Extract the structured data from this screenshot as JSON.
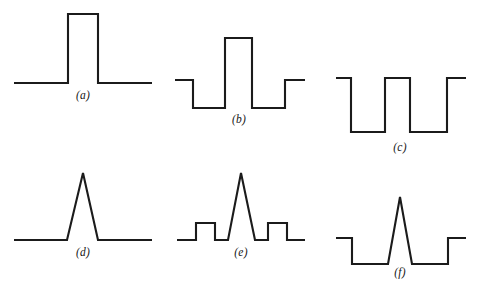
{
  "figure": {
    "title": "",
    "background_color": "#ffffff",
    "stroke_color": "#1b1b1b",
    "stroke_width": 2.1,
    "width": 480,
    "height": 294
  },
  "chart_data": {
    "type": "line",
    "title": "",
    "xlabel": "",
    "ylabel": "",
    "grid": false,
    "legend": false,
    "panels": [
      {
        "id": "a",
        "label": "(a)",
        "label_x": 83,
        "label_y": 95,
        "shape": "single rectangular pulse above baseline",
        "baseline_y": 83,
        "points": [
          [
            14,
            83
          ],
          [
            68,
            83
          ],
          [
            68,
            14
          ],
          [
            98,
            14
          ],
          [
            98,
            83
          ],
          [
            152,
            83
          ]
        ]
      },
      {
        "id": "b",
        "label": "(b)",
        "label_x": 239,
        "label_y": 119,
        "shape": "tall central rectangular pulse flanked by two negative rectangular dips",
        "baseline_y": 80,
        "points": [
          [
            175,
            80
          ],
          [
            193,
            80
          ],
          [
            193,
            108
          ],
          [
            225,
            108
          ],
          [
            225,
            38
          ],
          [
            252,
            38
          ],
          [
            252,
            108
          ],
          [
            285,
            108
          ],
          [
            285,
            80
          ],
          [
            305,
            80
          ]
        ]
      },
      {
        "id": "c",
        "label": "(c)",
        "label_x": 400,
        "label_y": 147,
        "shape": "square wave with two negative rectangular dips",
        "baseline_y": 78,
        "points": [
          [
            336,
            78
          ],
          [
            351,
            78
          ],
          [
            351,
            132
          ],
          [
            385,
            132
          ],
          [
            385,
            78
          ],
          [
            410,
            78
          ],
          [
            410,
            132
          ],
          [
            447,
            132
          ],
          [
            447,
            78
          ],
          [
            466,
            78
          ]
        ]
      },
      {
        "id": "d",
        "label": "(d)",
        "label_x": 83,
        "label_y": 252,
        "shape": "single triangular pulse above baseline",
        "baseline_y": 240,
        "points": [
          [
            14,
            240
          ],
          [
            67,
            240
          ],
          [
            83,
            173
          ],
          [
            98,
            240
          ],
          [
            152,
            240
          ]
        ]
      },
      {
        "id": "e",
        "label": "(e)",
        "label_x": 241,
        "label_y": 252,
        "shape": "central triangular pulse flanked by two small rectangular bumps",
        "baseline_y": 240,
        "points": [
          [
            177,
            240
          ],
          [
            196,
            240
          ],
          [
            196,
            223
          ],
          [
            215,
            223
          ],
          [
            215,
            240
          ],
          [
            228,
            240
          ],
          [
            241,
            173
          ],
          [
            255,
            240
          ],
          [
            268,
            240
          ],
          [
            268,
            223
          ],
          [
            287,
            223
          ],
          [
            287,
            240
          ],
          [
            305,
            240
          ]
        ]
      },
      {
        "id": "f",
        "label": "(f)",
        "label_x": 400,
        "label_y": 272,
        "shape": "central triangular pulse rising from a depressed baseline with rectangular dips on both sides",
        "baseline_y": 238,
        "points": [
          [
            336,
            238
          ],
          [
            352,
            238
          ],
          [
            352,
            264
          ],
          [
            388,
            264
          ],
          [
            400,
            197
          ],
          [
            412,
            264
          ],
          [
            448,
            264
          ],
          [
            448,
            238
          ],
          [
            466,
            238
          ]
        ]
      }
    ]
  }
}
